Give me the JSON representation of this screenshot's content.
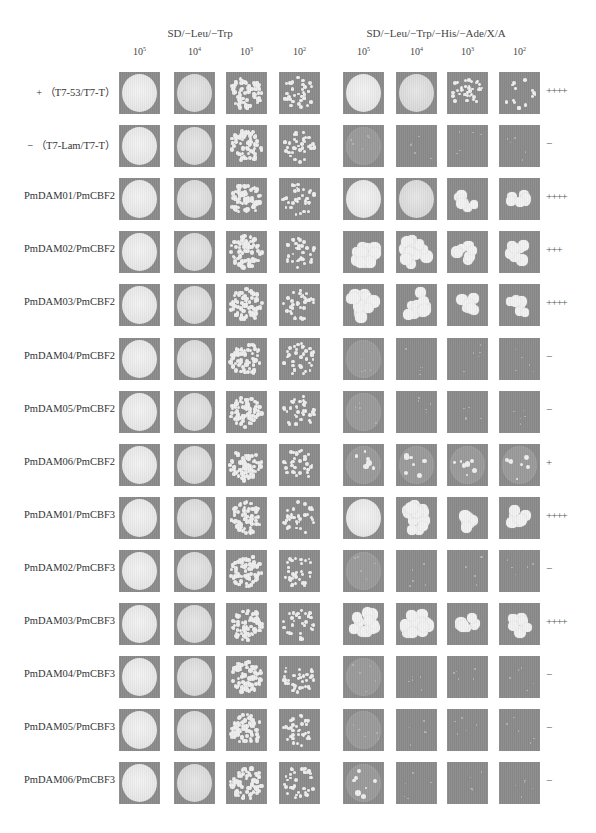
{
  "figure": {
    "panels": [
      {
        "title": "SD/−Leu/−Trp",
        "center_x": 200
      },
      {
        "title": "SD/−Leu/−Trp/−His/−Ade/X/A",
        "center_x": 436
      }
    ],
    "dilutions": [
      {
        "base": "10",
        "exp": "5"
      },
      {
        "base": "10",
        "exp": "4"
      },
      {
        "base": "10",
        "exp": "3"
      },
      {
        "base": "10",
        "exp": "2"
      }
    ],
    "column_x": [
      119,
      174,
      226,
      279,
      343,
      396,
      447,
      499
    ],
    "rows": [
      {
        "label": "+ （T7-53/T7-T）",
        "score": "++++",
        "growth": [
          4,
          4,
          3,
          2,
          4,
          4,
          2,
          1
        ],
        "type": "control"
      },
      {
        "label": "− （T7-Lam/T7-T）",
        "score": "−",
        "growth": [
          4,
          4,
          3,
          2,
          0,
          0,
          0,
          0
        ],
        "type": "control"
      },
      {
        "label": "PmDAM01/PmCBF2",
        "score": "++++",
        "growth": [
          4,
          4,
          3,
          2,
          4,
          4,
          5,
          5
        ],
        "type": "test"
      },
      {
        "label": "PmDAM02/PmCBF2",
        "score": "+++",
        "growth": [
          4,
          4,
          3,
          2,
          6,
          6,
          5,
          5
        ],
        "type": "test"
      },
      {
        "label": "PmDAM03/PmCBF2",
        "score": "++++",
        "growth": [
          4,
          4,
          3,
          2,
          6,
          6,
          5,
          5
        ],
        "type": "test"
      },
      {
        "label": "PmDAM04/PmCBF2",
        "score": "−",
        "growth": [
          4,
          4,
          3,
          2,
          0,
          0,
          0,
          0
        ],
        "type": "test"
      },
      {
        "label": "PmDAM05/PmCBF2",
        "score": "−",
        "growth": [
          4,
          4,
          3,
          2,
          0,
          0,
          0,
          0
        ],
        "type": "test"
      },
      {
        "label": "PmDAM06/PmCBF2",
        "score": "+",
        "growth": [
          4,
          4,
          3,
          2,
          7,
          7,
          7,
          7
        ],
        "type": "test"
      },
      {
        "label": "PmDAM01/PmCBF3",
        "score": "++++",
        "growth": [
          4,
          4,
          3,
          2,
          4,
          6,
          5,
          5
        ],
        "type": "test"
      },
      {
        "label": "PmDAM02/PmCBF3",
        "score": "−",
        "growth": [
          4,
          4,
          3,
          2,
          0,
          0,
          0,
          0
        ],
        "type": "test"
      },
      {
        "label": "PmDAM03/PmCBF3",
        "score": "++++",
        "growth": [
          4,
          4,
          3,
          2,
          6,
          6,
          5,
          5
        ],
        "type": "test"
      },
      {
        "label": "PmDAM04/PmCBF3",
        "score": "−",
        "growth": [
          4,
          4,
          3,
          2,
          0,
          0,
          0,
          0
        ],
        "type": "test"
      },
      {
        "label": "PmDAM05/PmCBF3",
        "score": "−",
        "growth": [
          4,
          4,
          3,
          2,
          0,
          0,
          0,
          0
        ],
        "type": "test"
      },
      {
        "label": "PmDAM06/PmCBF3",
        "score": "−",
        "growth": [
          4,
          4,
          3,
          2,
          7,
          0,
          0,
          0
        ],
        "type": "test"
      }
    ],
    "layout": {
      "first_row_top": 72,
      "row_step": 53.1
    },
    "colors": {
      "plate_bg": "#8a8a8a",
      "colony": "#efefef",
      "text": "#333333"
    }
  }
}
